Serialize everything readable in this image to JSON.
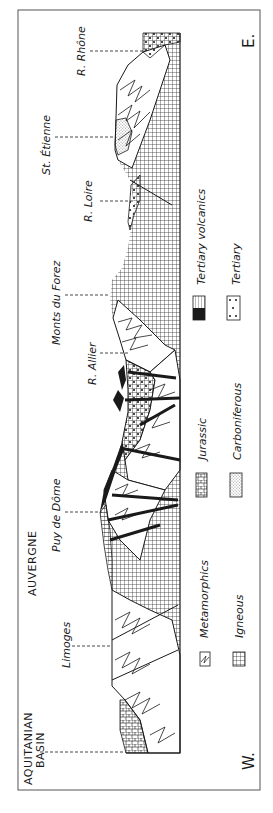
{
  "figure": {
    "type": "geological cross-section",
    "orientation": "rotated 90 degrees counter-clockwise (west at bottom, east at top)",
    "directions": {
      "west": "W.",
      "east": "E."
    },
    "colors": {
      "ink": "#1a1a1a",
      "paper": "#ffffff",
      "frame": "#555555"
    }
  },
  "regions": [
    {
      "label": "AQUITANIAN",
      "label2": "BASIN"
    },
    {
      "label": "AUVERGNE"
    }
  ],
  "places": [
    {
      "label": "Limoges"
    },
    {
      "label": "Puy de Dôme"
    },
    {
      "label": "R. Allier"
    },
    {
      "label": "Monts du Forez"
    },
    {
      "label": "R. Loire"
    },
    {
      "label": "St. Étienne"
    },
    {
      "label": "R. Rhône"
    }
  ],
  "legend": {
    "items": [
      {
        "label": "Metamorphics",
        "pattern": "zigzag-hatch"
      },
      {
        "label": "Igneous",
        "pattern": "grid"
      },
      {
        "label": "Jurassic",
        "pattern": "brick"
      },
      {
        "label": "Carboniferous",
        "pattern": "fine-stipple"
      },
      {
        "label": "Tertiary volcanics",
        "pattern": "vertical-lines-black"
      },
      {
        "label": "Tertiary",
        "pattern": "dots"
      }
    ]
  }
}
